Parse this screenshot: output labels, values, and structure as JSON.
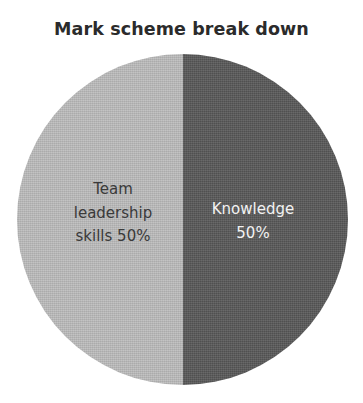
{
  "chart_data": {
    "type": "pie",
    "title": "Mark scheme break down",
    "categories": [
      "Team leadership skills",
      "Knowledge"
    ],
    "values": [
      50,
      50
    ],
    "value_unit": "%",
    "data_labels": [
      "Team\nleadership\nskills 50%",
      "Knowledge\n50%"
    ],
    "slice_colors": [
      "#bdbdbd",
      "#595959"
    ],
    "label_colors": [
      "#3a3a3a",
      "#f2f2f2"
    ],
    "start_angle_deg": 0,
    "direction": "clockwise",
    "legend": false,
    "grid": false,
    "xlabel": "",
    "ylabel": ""
  },
  "figure": {
    "title": "Mark scheme break down",
    "background_color": "#ffffff",
    "title_color": "#2b2b2b"
  },
  "slices": [
    {
      "name": "team-leadership-skills",
      "label": "Team\nleadership\nskills 50%",
      "value": 50,
      "color": "#bdbdbd",
      "label_color": "#3a3a3a"
    },
    {
      "name": "knowledge",
      "label": "Knowledge\n50%",
      "value": 50,
      "color": "#595959",
      "label_color": "#f2f2f2"
    }
  ]
}
